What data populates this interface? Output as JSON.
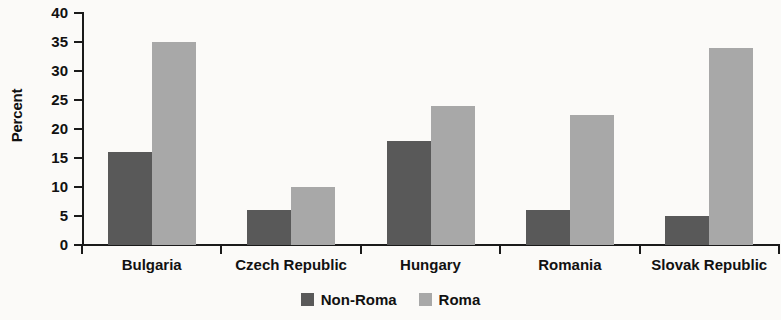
{
  "chart_data": {
    "type": "bar",
    "title": "",
    "subtitle": "",
    "xlabel": "",
    "ylabel": "Percent",
    "categories": [
      "Bulgaria",
      "Czech Republic",
      "Hungary",
      "Romania",
      "Slovak Republic"
    ],
    "series": [
      {
        "name": "Non-Roma",
        "color": "#595959",
        "values": [
          16,
          6,
          18,
          6,
          5
        ]
      },
      {
        "name": "Roma",
        "color": "#a8a8a8",
        "values": [
          35,
          10,
          24,
          22.5,
          34
        ]
      }
    ],
    "ylim": [
      0,
      40
    ],
    "ytick_labels": [
      "40",
      "35",
      "30",
      "25",
      "20",
      "15",
      "10",
      "5",
      "0"
    ],
    "ytick_values": [
      40,
      35,
      30,
      25,
      20,
      15,
      10,
      5,
      0
    ],
    "grid": false,
    "legend_position": "bottom-center",
    "legend_entries": [
      "Non-Roma",
      "Roma"
    ]
  }
}
